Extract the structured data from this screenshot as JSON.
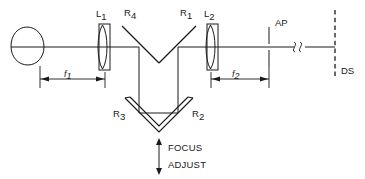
{
  "figure": {
    "background_color": "#ffffff",
    "line_color": "#1a1a1a"
  },
  "components": {
    "source": {
      "name": "light-source",
      "shape": "circle"
    },
    "lens1": {
      "label_base": "L",
      "label_sub": "1",
      "type": "biconvex-lens"
    },
    "lens2": {
      "label_base": "L",
      "label_sub": "2",
      "type": "biconvex-lens"
    },
    "mirror_r4": {
      "label_base": "R",
      "label_sub": "4",
      "type": "flat-mirror"
    },
    "mirror_r1": {
      "label_base": "R",
      "label_sub": "1",
      "type": "flat-mirror"
    },
    "mirror_r3": {
      "label_base": "R",
      "label_sub": "3",
      "type": "flat-mirror"
    },
    "mirror_r2": {
      "label_base": "R",
      "label_sub": "2",
      "type": "flat-mirror"
    },
    "aperture": {
      "label": "AP",
      "type": "aperture-stop"
    },
    "detector_screen": {
      "label": "DS",
      "type": "dashed-screen"
    },
    "break_symbol": {
      "name": "axis-break",
      "type": "squiggle"
    }
  },
  "dimensions": {
    "f1": {
      "label_base": "f",
      "label_sub": "1"
    },
    "f2": {
      "label_base": "f",
      "label_sub": "2"
    }
  },
  "annotations": {
    "focus_adjust": {
      "line1": "FOCUS",
      "line2": "ADJUST",
      "arrow": "double-headed-vertical"
    }
  }
}
